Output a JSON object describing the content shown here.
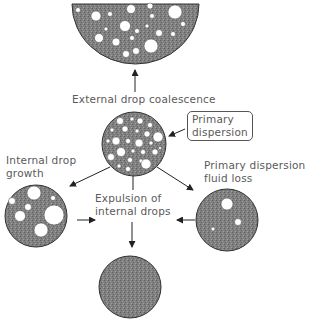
{
  "diagram": {
    "labels": {
      "external_coalescence": "External drop coalescence",
      "primary_dispersion_line1": "Primary",
      "primary_dispersion_line2": "dispersion",
      "internal_growth_line1": "Internal drop",
      "internal_growth_line2": "growth",
      "fluid_loss_line1": "Primary dispersion",
      "fluid_loss_line2": "fluid loss",
      "expulsion_line1": "Expulsion of",
      "expulsion_line2": "internal drops"
    },
    "colors": {
      "fill": "#7a7a7a",
      "stroke": "#333333",
      "drop": "#ffffff",
      "text": "#5a5a5a"
    },
    "nodes": [
      {
        "id": "coalesced-halfdisk",
        "description": "Half-disk with many drops (top)"
      },
      {
        "id": "primary-dispersion",
        "description": "Circle with many small drops (center)"
      },
      {
        "id": "internal-growth",
        "description": "Circle with few large drops (left)"
      },
      {
        "id": "fluid-loss",
        "description": "Circle with 3 small drops (right)"
      },
      {
        "id": "final-state",
        "description": "Solid circle, no drops (bottom)"
      }
    ]
  }
}
